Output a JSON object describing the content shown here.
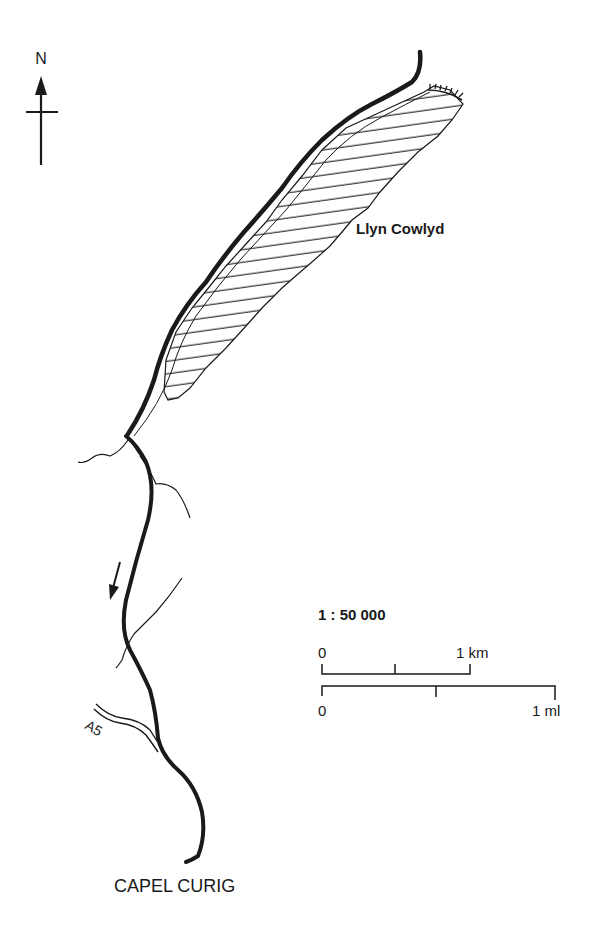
{
  "map": {
    "north_label": "N",
    "lake_name": "Llyn Cowlyd",
    "town_name": "CAPEL CURIG",
    "road_label": "A5",
    "scale": {
      "ratio": "1 : 50 000",
      "km_start": "0",
      "km_end": "1 km",
      "mi_start": "0",
      "mi_end": "1 ml"
    },
    "colors": {
      "ink": "#1a1a1a",
      "background": "#ffffff"
    }
  }
}
